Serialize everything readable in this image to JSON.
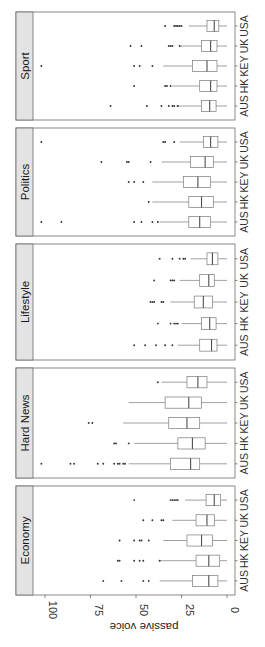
{
  "chart_data": {
    "type": "boxplot",
    "orientation": "rotated 90 degrees clockwise (facets stacked vertically, value axis horizontal at bottom)",
    "title": "",
    "ylabel": "passive voice",
    "xlabel": "",
    "ylim": [
      0,
      105
    ],
    "yticks": [
      0,
      25,
      50,
      75,
      100
    ],
    "categories": [
      "AUS",
      "HK",
      "KEY",
      "UK",
      "USA"
    ],
    "facets": [
      {
        "name": "Economy",
        "boxes": [
          {
            "cat": "AUS",
            "q1": 5,
            "median": 10,
            "q3": 19,
            "whisker_low": 0,
            "whisker_high": 37,
            "outliers": [
              43,
              46,
              58,
              68
            ]
          },
          {
            "cat": "HK",
            "q1": 4,
            "median": 10,
            "q3": 17,
            "whisker_low": 0,
            "whisker_high": 37,
            "outliers": [
              37,
              46,
              48,
              51,
              59,
              60
            ]
          },
          {
            "cat": "KEY",
            "q1": 8,
            "median": 14,
            "q3": 22,
            "whisker_low": 0,
            "whisker_high": 35,
            "outliers": [
              43,
              47,
              48,
              51,
              59
            ]
          },
          {
            "cat": "UK",
            "q1": 7,
            "median": 11,
            "q3": 17,
            "whisker_low": 0,
            "whisker_high": 30,
            "outliers": [
              35,
              36,
              41,
              46
            ]
          },
          {
            "cat": "USA",
            "q1": 3.5,
            "median": 7,
            "q3": 11.5,
            "whisker_low": 0,
            "whisker_high": 23,
            "outliers": [
              27,
              28,
              29,
              30,
              31,
              51
            ]
          }
        ]
      },
      {
        "name": "Hard News",
        "boxes": [
          {
            "cat": "AUS",
            "q1": 15,
            "median": 20,
            "q3": 31,
            "whisker_low": 0,
            "whisker_high": 54,
            "outliers": [
              56,
              57,
              59,
              60,
              62,
              68,
              71,
              84,
              86,
              102
            ]
          },
          {
            "cat": "HK",
            "q1": 12,
            "median": 19,
            "q3": 27,
            "whisker_low": 0,
            "whisker_high": 51,
            "outliers": [
              54,
              61,
              62
            ]
          },
          {
            "cat": "KEY",
            "q1": 15,
            "median": 22,
            "q3": 32,
            "whisker_low": 0,
            "whisker_high": 57,
            "outliers": [
              74,
              76
            ]
          },
          {
            "cat": "UK",
            "q1": 14,
            "median": 21,
            "q3": 34,
            "whisker_low": 0,
            "whisker_high": 54,
            "outliers": []
          },
          {
            "cat": "USA",
            "q1": 11,
            "median": 16,
            "q3": 22,
            "whisker_low": 0,
            "whisker_high": 36,
            "outliers": [
              38
            ]
          }
        ]
      },
      {
        "name": "Lifestyle",
        "boxes": [
          {
            "cat": "AUS",
            "q1": 5.5,
            "median": 8.5,
            "q3": 15,
            "whisker_low": 0,
            "whisker_high": 27,
            "outliers": [
              30,
              34,
              39,
              45,
              51
            ]
          },
          {
            "cat": "HK",
            "q1": 6,
            "median": 9.5,
            "q3": 14,
            "whisker_low": 0,
            "whisker_high": 25,
            "outliers": [
              27,
              28,
              29,
              31,
              38
            ]
          },
          {
            "cat": "KEY",
            "q1": 8,
            "median": 13,
            "q3": 18,
            "whisker_low": 0,
            "whisker_high": 31,
            "outliers": [
              35,
              36,
              40,
              41,
              42
            ]
          },
          {
            "cat": "UK",
            "q1": 7,
            "median": 10,
            "q3": 15,
            "whisker_low": 0,
            "whisker_high": 26,
            "outliers": [
              29,
              30,
              31,
              40
            ]
          },
          {
            "cat": "USA",
            "q1": 5,
            "median": 8,
            "q3": 11,
            "whisker_low": 0,
            "whisker_high": 20,
            "outliers": [
              23,
              24,
              26,
              30,
              37
            ]
          }
        ]
      },
      {
        "name": "Politics",
        "boxes": [
          {
            "cat": "AUS",
            "q1": 9,
            "median": 15,
            "q3": 21,
            "whisker_low": 0,
            "whisker_high": 37,
            "outliers": [
              38,
              41,
              47,
              51,
              91,
              102
            ]
          },
          {
            "cat": "HK",
            "q1": 7.5,
            "median": 14,
            "q3": 21,
            "whisker_low": 0,
            "whisker_high": 41,
            "outliers": [
              43
            ]
          },
          {
            "cat": "KEY",
            "q1": 9,
            "median": 16,
            "q3": 24,
            "whisker_low": 0,
            "whisker_high": 41,
            "outliers": [
              46,
              51,
              54
            ]
          },
          {
            "cat": "UK",
            "q1": 7.5,
            "median": 12,
            "q3": 20,
            "whisker_low": 0,
            "whisker_high": 36,
            "outliers": [
              42,
              54,
              55,
              69
            ]
          },
          {
            "cat": "USA",
            "q1": 5,
            "median": 9,
            "q3": 13,
            "whisker_low": 0,
            "whisker_high": 26,
            "outliers": [
              29,
              34,
              35,
              102
            ]
          }
        ]
      },
      {
        "name": "Sport",
        "boxes": [
          {
            "cat": "AUS",
            "q1": 6,
            "median": 9.5,
            "q3": 14,
            "whisker_low": 0,
            "whisker_high": 28,
            "outliers": [
              27,
              29,
              30,
              32,
              36,
              44,
              64
            ]
          },
          {
            "cat": "HK",
            "q1": 5.5,
            "median": 9,
            "q3": 15,
            "whisker_low": 0,
            "whisker_high": 30,
            "outliers": [
              31,
              33,
              34,
              51
            ]
          },
          {
            "cat": "KEY",
            "q1": 5.5,
            "median": 11,
            "q3": 19,
            "whisker_low": 0,
            "whisker_high": 35,
            "outliers": [
              41,
              48,
              51,
              102
            ]
          },
          {
            "cat": "UK",
            "q1": 5.5,
            "median": 9,
            "q3": 14,
            "whisker_low": 0,
            "whisker_high": 26,
            "outliers": [
              26,
              30,
              31,
              32,
              47,
              53
            ]
          },
          {
            "cat": "USA",
            "q1": 4.5,
            "median": 7,
            "q3": 11,
            "whisker_low": 0,
            "whisker_high": 21,
            "outliers": [
              25,
              26,
              27,
              28,
              29,
              34
            ]
          }
        ]
      }
    ],
    "grid": false,
    "legend": null
  },
  "axis": {
    "title": "passive voice",
    "ticks": [
      "0",
      "25",
      "50",
      "75",
      "100"
    ]
  }
}
